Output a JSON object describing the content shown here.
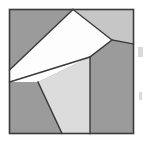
{
  "figure": {
    "caption": "",
    "canvas": {
      "width": 145,
      "height": 142,
      "background": "#ffffff"
    },
    "frame": {
      "name": "outer-square",
      "x": 9.5,
      "y": 9.5,
      "width": 124,
      "height": 124,
      "stroke": "#3a3a3a",
      "stroke_width": 1.6,
      "fill": "none"
    },
    "palette": {
      "dark_gray": "#9b9b9b",
      "mid_gray": "#b5b5b5",
      "light_gray": "#d9d9d9",
      "white": "#fdfdfd",
      "outline": "#3a3a3a",
      "background": "#ffffff",
      "speck": "#b9b9b9"
    },
    "stroke_width": 1.4,
    "pieces": [
      {
        "id": "piece-1",
        "name": "dark-gray-background-region",
        "label": "dark gray background",
        "fill": "#9b9b9b",
        "points": "9.5,9.5 133.5,9.5 133.5,133.5 9.5,133.5"
      },
      {
        "id": "piece-2",
        "name": "light-gray-top-right-triangle",
        "label": "light gray top-right triangle",
        "fill": "#c6c6c6",
        "points": "73,9.5 133.5,9.5 133.5,44 112,40"
      },
      {
        "id": "piece-3",
        "name": "white-wedge-polygon",
        "label": "white wedge polygon",
        "fill": "#fdfdfd",
        "points": "73,9.5 112,40 90,57 38,82 9.5,82 9.5,70"
      },
      {
        "id": "piece-4",
        "name": "light-gray-lower-quadrilateral",
        "label": "light gray lower quadrilateral",
        "fill": "#dcdcdc",
        "points": "38,82 90,57 90,133.5 62,133.5"
      }
    ],
    "edges": [
      {
        "name": "edge-top-vertex-to-right-vertex",
        "x1": 73,
        "y1": 9.5,
        "x2": 112,
        "y2": 40
      },
      {
        "name": "edge-right-vertex-to-frame-right",
        "x1": 112,
        "y1": 40,
        "x2": 133.5,
        "y2": 44
      },
      {
        "name": "edge-right-vertex-to-mid",
        "x1": 112,
        "y1": 40,
        "x2": 90,
        "y2": 57
      },
      {
        "name": "edge-mid-to-left-edge",
        "x1": 90,
        "y1": 57,
        "x2": 9.5,
        "y2": 82
      },
      {
        "name": "edge-left-edge-to-top-vertex",
        "x1": 9.5,
        "y1": 70,
        "x2": 73,
        "y2": 9.5
      },
      {
        "name": "edge-vertical-divider",
        "x1": 90,
        "y1": 57,
        "x2": 90,
        "y2": 133.5
      },
      {
        "name": "edge-lower-left-diagonal",
        "x1": 38,
        "y1": 82,
        "x2": 62,
        "y2": 133.5
      }
    ],
    "specks": [
      {
        "name": "speck-upper-right",
        "x": 138,
        "y": 47,
        "width": 5,
        "height": 10
      },
      {
        "name": "speck-lower-right",
        "x": 139,
        "y": 92,
        "width": 3,
        "height": 8
      }
    ]
  }
}
